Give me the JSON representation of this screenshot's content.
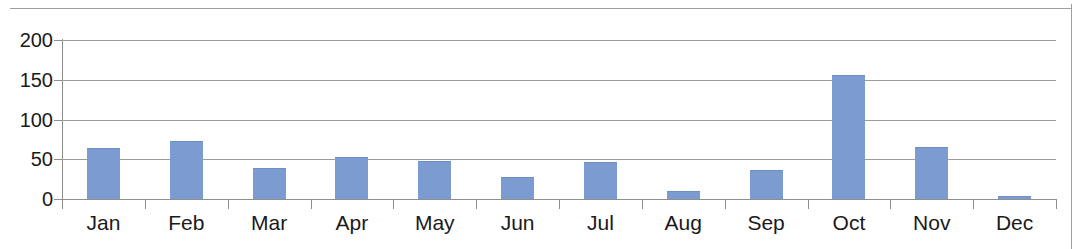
{
  "chart_data": {
    "type": "bar",
    "title": "",
    "subtitle": "",
    "xlabel": "",
    "ylabel": "",
    "categories": [
      "Jan",
      "Feb",
      "Mar",
      "Apr",
      "May",
      "Jun",
      "Jul",
      "Aug",
      "Sep",
      "Oct",
      "Nov",
      "Dec"
    ],
    "values": [
      63,
      72,
      38,
      52,
      47,
      26,
      45,
      9,
      35,
      155,
      64,
      3
    ],
    "series": [
      {
        "name": "",
        "values": [
          63,
          72,
          38,
          52,
          47,
          26,
          45,
          9,
          35,
          155,
          64,
          3
        ],
        "color": "#7b9bd1"
      }
    ],
    "ylim": [
      0,
      200
    ],
    "ytick_labels": [
      "0",
      "50",
      "100",
      "150",
      "200"
    ],
    "ytick_values": [
      0,
      50,
      100,
      150,
      200
    ],
    "xtick_labels": [
      "Jan",
      "Feb",
      "Mar",
      "Apr",
      "May",
      "Jun",
      "Jul",
      "Aug",
      "Sep",
      "Oct",
      "Nov",
      "Dec"
    ],
    "grid": true,
    "grid_axis": "y",
    "grid_color": "#9c9c99",
    "legend": false,
    "legend_position": "none",
    "bar_color": "#7b9bd1",
    "axis_color": "#8f8f8c",
    "text_color": "#1a1a1a",
    "background": "#ffffff"
  },
  "page": {
    "top_rule": "",
    "right_rule": ""
  }
}
